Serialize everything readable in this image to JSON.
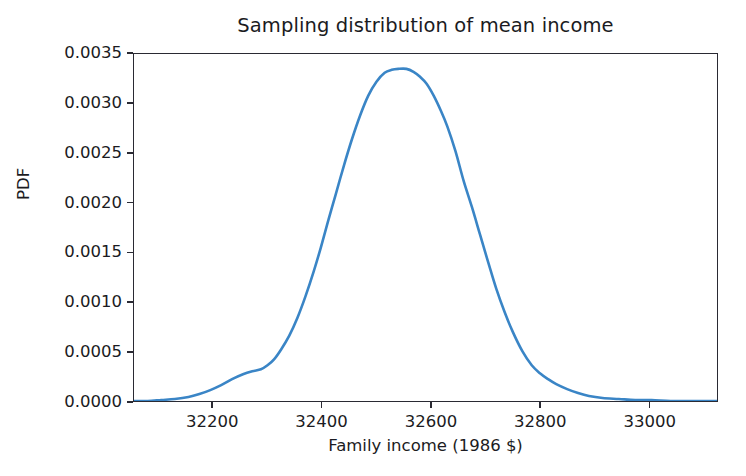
{
  "chart_data": {
    "type": "line",
    "title": "Sampling distribution of mean income",
    "xlabel": "Family income (1986 $)",
    "ylabel": "PDF",
    "grid": false,
    "legend": null,
    "line_color": "#3a85c6",
    "line_width": 2.6,
    "xlim": [
      32055,
      33125
    ],
    "ylim": [
      0.0,
      0.0035
    ],
    "xticks": [
      32200,
      32400,
      32600,
      32800,
      33000
    ],
    "xtick_labels": [
      "32200",
      "32400",
      "32600",
      "32800",
      "33000"
    ],
    "yticks": [
      0.0,
      0.0005,
      0.001,
      0.0015,
      0.002,
      0.0025,
      0.003,
      0.0035
    ],
    "ytick_labels": [
      "0.0000",
      "0.0005",
      "0.0010",
      "0.0015",
      "0.0020",
      "0.0025",
      "0.0030",
      "0.0035"
    ],
    "series": [
      {
        "name": "Sampling distribution of mean income",
        "x": [
          32055,
          32080,
          32105,
          32130,
          32155,
          32175,
          32195,
          32215,
          32235,
          32255,
          32272,
          32288,
          32300,
          32312,
          32325,
          32340,
          32355,
          32370,
          32385,
          32398,
          32412,
          32425,
          32440,
          32455,
          32470,
          32485,
          32500,
          32515,
          32528,
          32540,
          32555,
          32568,
          32580,
          32592,
          32605,
          32618,
          32630,
          32645,
          32660,
          32675,
          32690,
          32705,
          32720,
          32735,
          32750,
          32768,
          32785,
          32800,
          32815,
          32830,
          32850,
          32870,
          32890,
          32915,
          32945,
          32975,
          33005,
          33040,
          33080,
          33125
        ],
        "y": [
          0.0,
          0.0,
          1e-05,
          2e-05,
          4e-05,
          7e-05,
          0.00011,
          0.00016,
          0.00022,
          0.00027,
          0.0003,
          0.00032,
          0.00036,
          0.00042,
          0.00052,
          0.00066,
          0.00084,
          0.00106,
          0.00131,
          0.00155,
          0.00183,
          0.00208,
          0.00237,
          0.00264,
          0.00288,
          0.00308,
          0.00322,
          0.00331,
          0.00334,
          0.00335,
          0.00335,
          0.00332,
          0.00327,
          0.0032,
          0.00308,
          0.00293,
          0.00277,
          0.00252,
          0.00222,
          0.00196,
          0.00168,
          0.0014,
          0.00113,
          0.0009,
          0.0007,
          0.0005,
          0.00036,
          0.00028,
          0.00022,
          0.00017,
          0.00012,
          8e-05,
          5e-05,
          3e-05,
          2e-05,
          1e-05,
          1e-05,
          0.0,
          0.0,
          0.0
        ]
      }
    ],
    "annotations": {
      "peak_x": 32555,
      "peak_y": 0.00335,
      "left_shoulder_x": 32288,
      "right_shoulder_x": 32830
    }
  }
}
